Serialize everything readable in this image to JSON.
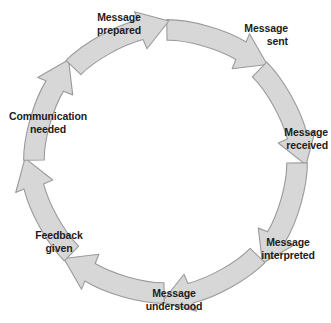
{
  "diagram": {
    "type": "cycle",
    "background_color": "#ffffff",
    "text_color": "#1c1c1c",
    "arrow_fill_color": "#d7d7d7",
    "arrow_stroke_color": "#9a9a9a",
    "direction": "clockwise",
    "stage_count": 8,
    "arrow_count": 8,
    "stages": [
      {
        "id": "message-prepared",
        "label": "Message\nprepared",
        "align": "center",
        "angle_deg": 315
      },
      {
        "id": "message-sent",
        "label": "Message\nsent",
        "align": "right",
        "angle_deg": 0
      },
      {
        "id": "message-received",
        "label": "Message\nreceived",
        "align": "right",
        "angle_deg": 45
      },
      {
        "id": "message-interpreted",
        "label": "Message\ninterpreted",
        "align": "center",
        "angle_deg": 90
      },
      {
        "id": "message-understood",
        "label": "Message\nunderstood",
        "align": "center",
        "angle_deg": 135
      },
      {
        "id": "feedback-given",
        "label": "Feedback\ngiven",
        "align": "center",
        "angle_deg": 180
      },
      {
        "id": "communication-needed",
        "label": "Communication\nneeded",
        "align": "center",
        "angle_deg": 225
      }
    ],
    "arrows": [
      {
        "id": "arrow-prepared-to-sent",
        "from": "message-prepared",
        "to": "message-sent",
        "rotation_deg": 0
      },
      {
        "id": "arrow-sent-to-received",
        "from": "message-sent",
        "to": "message-received",
        "rotation_deg": 45
      },
      {
        "id": "arrow-received-to-interpreted",
        "from": "message-received",
        "to": "message-interpreted",
        "rotation_deg": 90
      },
      {
        "id": "arrow-interpreted-to-understood",
        "from": "message-interpreted",
        "to": "message-understood",
        "rotation_deg": 135
      },
      {
        "id": "arrow-understood-to-feedback",
        "from": "message-understood",
        "to": "feedback-given",
        "rotation_deg": 180
      },
      {
        "id": "arrow-feedback-to-communication",
        "from": "feedback-given",
        "to": "communication-needed",
        "rotation_deg": 225
      },
      {
        "id": "arrow-communication-to-prepared",
        "from": "communication-needed",
        "to": "message-prepared",
        "rotation_deg": 270
      },
      {
        "id": "arrow-ring-close",
        "from": "message-prepared",
        "to": "message-sent",
        "rotation_deg": 315
      }
    ]
  }
}
